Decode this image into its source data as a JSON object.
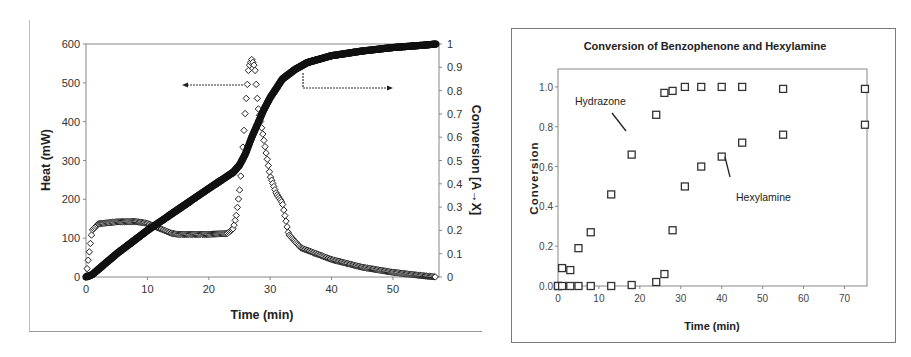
{
  "chart_data": [
    {
      "type": "scatter",
      "title": "",
      "xlabel": "Time (min)",
      "ylabel": "Heat (mW)",
      "y2label": "Conversion [A→X]",
      "xlim": [
        0,
        57.5
      ],
      "ylim": [
        0,
        600
      ],
      "y2lim": [
        0,
        1
      ],
      "xticks": [
        "0",
        "10",
        "20",
        "30",
        "40",
        "50"
      ],
      "yticks": [
        "0",
        "100",
        "200",
        "300",
        "400",
        "500",
        "600"
      ],
      "y2ticks": [
        "0",
        "0.1",
        "0.2",
        "0.3",
        "0.4",
        "0.5",
        "0.6",
        "0.7",
        "0.8",
        "0.9",
        "1"
      ],
      "grid": false,
      "annotations": [
        {
          "type": "arrow",
          "direction": "left",
          "meaning": "heat curve uses left axis"
        },
        {
          "type": "arrow",
          "direction": "right",
          "meaning": "conversion curve uses right axis"
        }
      ],
      "series": [
        {
          "name": "Heat",
          "axis": "left",
          "marker": "open-diamond",
          "x": [
            0,
            0.5,
            1,
            2,
            5,
            8,
            10,
            12,
            14,
            15,
            20,
            23,
            24,
            24.5,
            25,
            25.5,
            26,
            26.5,
            27,
            27.5,
            28,
            29,
            30,
            31,
            32,
            33,
            35,
            40,
            45,
            50,
            55,
            57
          ],
          "y": [
            0,
            60,
            120,
            137,
            142,
            143,
            138,
            125,
            112,
            110,
            110,
            112,
            125,
            160,
            220,
            320,
            440,
            540,
            560,
            540,
            440,
            350,
            260,
            215,
            190,
            110,
            75,
            45,
            25,
            12,
            3,
            0
          ]
        },
        {
          "name": "Conversion",
          "axis": "right",
          "marker": "filled-circle",
          "x": [
            0,
            1,
            5,
            10,
            15,
            20,
            24,
            25,
            26,
            27,
            28,
            29,
            30,
            32,
            34,
            36,
            40,
            45,
            50,
            55,
            57
          ],
          "y": [
            0,
            0.01,
            0.1,
            0.2,
            0.29,
            0.38,
            0.45,
            0.48,
            0.53,
            0.6,
            0.66,
            0.72,
            0.77,
            0.85,
            0.89,
            0.92,
            0.95,
            0.97,
            0.985,
            0.995,
            1.0
          ]
        }
      ]
    },
    {
      "type": "scatter",
      "title": "Conversion of Benzophenone and Hexylamine",
      "xlabel": "Time (min)",
      "ylabel": "Conversion",
      "xlim": [
        0,
        75.5
      ],
      "ylim": [
        0,
        1.09
      ],
      "xticks": [
        "0",
        "10",
        "20",
        "30",
        "40",
        "50",
        "60",
        "70"
      ],
      "yticks": [
        "0.0",
        "0.2",
        "0.4",
        "0.6",
        "0.8",
        "1.0"
      ],
      "grid": false,
      "annotations": [
        {
          "text": "Hydrazone",
          "points_to": [
            17,
            0.76
          ]
        },
        {
          "text": "Hexylamine",
          "points_to": [
            40.5,
            0.63
          ]
        }
      ],
      "series": [
        {
          "name": "Hydrazone",
          "marker": "open-square",
          "x": [
            0,
            1,
            3,
            5,
            8,
            13,
            18,
            24,
            26,
            28,
            31,
            35,
            40,
            45,
            55,
            75
          ],
          "y": [
            0.0,
            0.09,
            0.08,
            0.19,
            0.27,
            0.46,
            0.66,
            0.86,
            0.97,
            0.98,
            1.0,
            1.0,
            1.0,
            1.0,
            0.99,
            0.99
          ]
        },
        {
          "name": "Hexylamine",
          "marker": "open-square",
          "x": [
            0,
            1,
            3,
            5,
            8,
            13,
            18,
            24,
            26,
            28,
            31,
            35,
            40,
            45,
            55,
            75
          ],
          "y": [
            0.0,
            0.0,
            0.0,
            0.0,
            0.0,
            0.0,
            0.005,
            0.02,
            0.06,
            0.28,
            0.5,
            0.6,
            0.65,
            0.72,
            0.76,
            0.81
          ]
        }
      ]
    }
  ],
  "left_chart": {
    "xlabel": "Time (min)",
    "ylabel": "Heat (mW)",
    "y2label": "Conversion [A→X]"
  },
  "right_chart": {
    "title": "Conversion of Benzophenone and Hexylamine",
    "xlabel": "Time (min)",
    "ylabel": "Conversion",
    "label_hydrazone": "Hydrazone",
    "label_hexylamine": "Hexylamine"
  }
}
